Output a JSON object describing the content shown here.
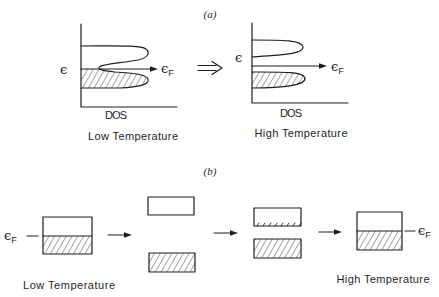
{
  "colors": {
    "ink": "#1e1e1e",
    "background": "#ffffff"
  },
  "panel_a": {
    "label": "(a)",
    "transition_arrow": "double-arrow-right",
    "low_temperature": {
      "energy_axis_label": "ϵ",
      "fermi_symbol": "ϵ",
      "fermi_subscript": "F",
      "x_axis_label": "DOS",
      "caption": "Low Temperature"
    },
    "high_temperature": {
      "energy_axis_label": "ϵ",
      "fermi_symbol": "ϵ",
      "fermi_subscript": "F",
      "x_axis_label": "DOS",
      "caption": "High Temperature"
    }
  },
  "panel_b": {
    "label": "(b)",
    "fermi_left": {
      "symbol": "ϵ",
      "subscript": "F"
    },
    "fermi_right": {
      "symbol": "ϵ",
      "subscript": "F"
    },
    "caption_low": "Low Temperature",
    "caption_high": "High Temperature",
    "stages": [
      {
        "name": "single-band-half-filled"
      },
      {
        "name": "split-bands-gap"
      },
      {
        "name": "split-bands-thermally-excited"
      },
      {
        "name": "single-band-half-filled"
      }
    ]
  }
}
